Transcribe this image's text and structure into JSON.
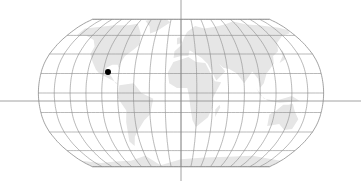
{
  "map": {
    "projection": "robinson",
    "colors": {
      "background": "#ffffff",
      "land": "#e6e6e6",
      "graticule": "#8a8a8a",
      "outline": "#8a8a8a",
      "crosshair": "#8a8a8a",
      "marker": "#000000"
    },
    "graticule": {
      "meridian_step_deg": 20,
      "parallel_step_deg": 20
    },
    "crosshair": {
      "x": 181,
      "y": 101
    },
    "marker": {
      "label": "",
      "x": 108,
      "y": 72,
      "radius": 3
    }
  }
}
